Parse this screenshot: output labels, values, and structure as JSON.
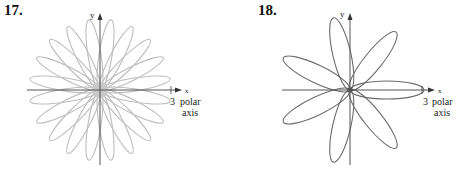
{
  "figures": [
    {
      "number": "17.",
      "y_label": "y",
      "x_label": "x",
      "tick_label": "3",
      "axis_label_line1": "polar",
      "axis_label_line2": "axis",
      "petal_count": 20,
      "petal_offset_deg": 9,
      "petal_color": "#bdbdbd",
      "center_disk": true
    },
    {
      "number": "18.",
      "y_label": "y",
      "x_label": "x",
      "tick_label": "3",
      "axis_label_line1": "polar",
      "axis_label_line2": "axis",
      "petal_count": 7,
      "petal_offset_deg": 0,
      "petal_color": "#6b6b6b",
      "center_disk": false
    }
  ],
  "chart_data": [
    {
      "type": "polar-rose",
      "title": "17.",
      "petals": 20,
      "petal_angles_deg": [
        9,
        27,
        45,
        63,
        81,
        99,
        117,
        135,
        153,
        171,
        189,
        207,
        225,
        243,
        261,
        279,
        297,
        315,
        333,
        351
      ],
      "max_radius": 3,
      "xlabel": "x (polar axis)",
      "ylabel": "y",
      "ticks": [
        "3"
      ]
    },
    {
      "type": "polar-rose",
      "title": "18.",
      "petals": 7,
      "petal_angles_deg": [
        0,
        51.4,
        102.9,
        154.3,
        205.7,
        257.1,
        308.6
      ],
      "max_radius": 3,
      "xlabel": "x (polar axis)",
      "ylabel": "y",
      "ticks": [
        "3"
      ]
    }
  ]
}
